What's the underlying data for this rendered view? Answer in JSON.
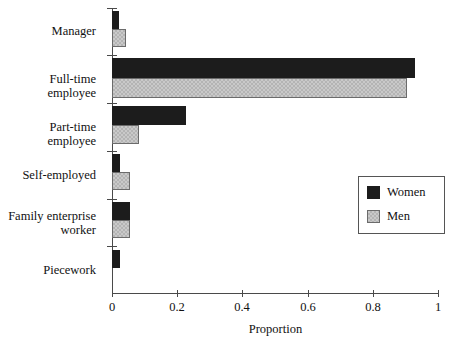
{
  "chart_data": {
    "type": "bar",
    "orientation": "horizontal",
    "title": "",
    "xlabel": "Proportion",
    "ylabel": "",
    "xlim": [
      0,
      1
    ],
    "xticks": [
      "0",
      "0.2",
      "0.4",
      "0.6",
      "0.8",
      "1"
    ],
    "xtick_values": [
      0,
      0.2,
      0.4,
      0.6,
      0.8,
      1
    ],
    "grid": false,
    "legend_position": "center-right",
    "categories": [
      "Manager",
      "Full-time employee",
      "Part-time employee",
      "Self-employed",
      "Family enterprise\nworker",
      "Piecework"
    ],
    "series": [
      {
        "name": "Women",
        "color": "#1c1c1c",
        "values": [
          0.022,
          0.93,
          0.227,
          0.025,
          0.055,
          0.025
        ]
      },
      {
        "name": "Men",
        "color": "#c9c9c9",
        "values": [
          0.042,
          0.905,
          0.083,
          0.055,
          0.055,
          0.0
        ]
      }
    ]
  },
  "axis": {
    "x_title": "Proportion"
  },
  "legend": {
    "items": [
      {
        "label": "Women"
      },
      {
        "label": "Men"
      }
    ]
  }
}
